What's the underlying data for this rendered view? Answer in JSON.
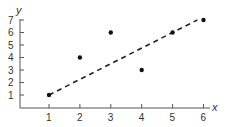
{
  "chart_data": {
    "type": "scatter",
    "title": "",
    "xlabel": "x",
    "ylabel": "y",
    "xlim": [
      0,
      6.2
    ],
    "ylim": [
      0,
      7.2
    ],
    "x_ticks": [
      1,
      2,
      3,
      4,
      5,
      6
    ],
    "y_ticks": [
      1,
      2,
      3,
      4,
      5,
      6,
      7
    ],
    "grid": false,
    "legend": null,
    "series": [
      {
        "name": "points",
        "type": "scatter",
        "x": [
          1,
          2,
          3,
          4,
          5,
          6
        ],
        "y": [
          1,
          4,
          6,
          3,
          6,
          7
        ]
      },
      {
        "name": "trend line",
        "type": "line",
        "style": "dashed",
        "x": [
          1,
          5.8
        ],
        "y": [
          1,
          7
        ]
      }
    ]
  },
  "colors": {
    "axis": "#555555",
    "points": "#111111",
    "line": "#222222"
  }
}
